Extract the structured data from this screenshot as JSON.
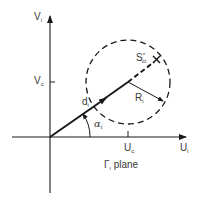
{
  "diagram": {
    "caption": {
      "symbol": "Γ",
      "subscript": "i",
      "text": "plane"
    },
    "axes": {
      "horizontal": {
        "label": "U",
        "subscript": "i"
      },
      "vertical": {
        "label": "V",
        "subscript": "i"
      }
    },
    "ticks": {
      "u_center": {
        "label": "U",
        "subscript": "c"
      },
      "v_center": {
        "label": "V",
        "subscript": "c"
      }
    },
    "vector": {
      "label": "d",
      "subscript": "i"
    },
    "angle": {
      "label": "α",
      "subscript": "i"
    },
    "radius": {
      "label": "R",
      "subscript": "i"
    },
    "point": {
      "label": "S",
      "subscript": "ci",
      "superscript": "*",
      "marker": "X"
    },
    "colors": {
      "stroke": "#1a1a1a",
      "text": "#3a3a3a",
      "background": "#ffffff"
    }
  }
}
